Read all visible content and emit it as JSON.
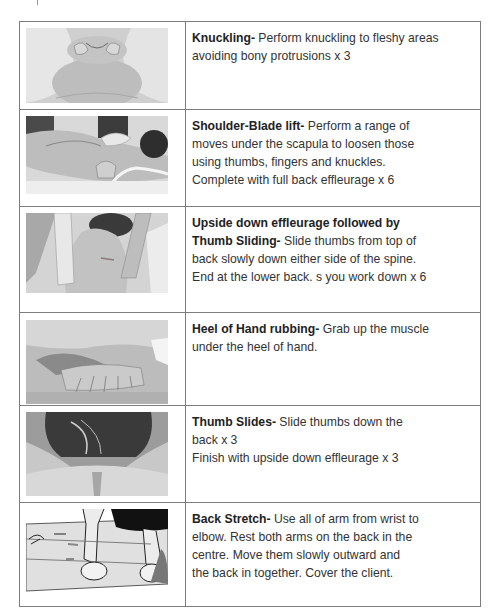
{
  "rows": [
    {
      "image": "knuckling-photo",
      "title": "Knuckling-",
      "lines": [
        " Perform knuckling to fleshy areas",
        "avoiding bony protrusions x 3"
      ]
    },
    {
      "image": "shoulder-blade-lift-photo",
      "title": "Shoulder-Blade lift-",
      "lines": [
        " Perform a range of",
        "moves under the scapula to loosen those",
        "using thumbs, fingers and knuckles.",
        "Complete with full back effleurage x 6"
      ]
    },
    {
      "image": "upside-down-effleurage-photo",
      "title": "Upside down effleurage followed by",
      "title2": "Thumb Sliding-",
      "lines": [
        " Slide thumbs from top of",
        "back slowly down either side of the spine.",
        "End at the lower back. s you work down x 6"
      ]
    },
    {
      "image": "heel-of-hand-photo",
      "title": "Heel of Hand rubbing-",
      "lines": [
        " Grab up the muscle",
        "under the heel of hand."
      ]
    },
    {
      "image": "thumb-slides-photo",
      "title": "Thumb Slides-",
      "lines": [
        " Slide thumbs down the",
        "back x 3",
        "Finish with upside down effleurage x 3"
      ]
    },
    {
      "image": "back-stretch-illustration",
      "title": "Back Stretch-",
      "lines": [
        " Use all of arm from wrist to",
        "elbow. Rest both arms on the back in the",
        "centre. Move them slowly outward and",
        "the back in together. Cover the client."
      ]
    }
  ]
}
